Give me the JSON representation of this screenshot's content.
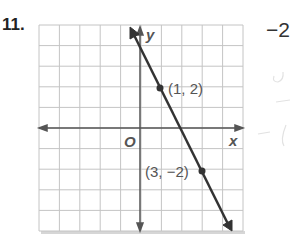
{
  "problem": {
    "number": "11.",
    "answer": "−2",
    "handwritten_marks": "faint pencil marks"
  },
  "chart_data": {
    "type": "line",
    "title": "",
    "xlabel": "x",
    "ylabel": "y",
    "origin_label": "O",
    "xlim": [
      -5,
      5
    ],
    "ylim": [
      -5,
      5
    ],
    "grid": true,
    "line": {
      "slope": -2,
      "intercept": 4,
      "equation": "y = -2x + 4"
    },
    "points": [
      {
        "x": 1,
        "y": 2,
        "label": "(1, 2)"
      },
      {
        "x": 3,
        "y": -2,
        "label": "(3, −2)"
      }
    ],
    "colors": {
      "grid": "#bdbdbd",
      "axis": "#444444",
      "line": "#333333"
    }
  }
}
